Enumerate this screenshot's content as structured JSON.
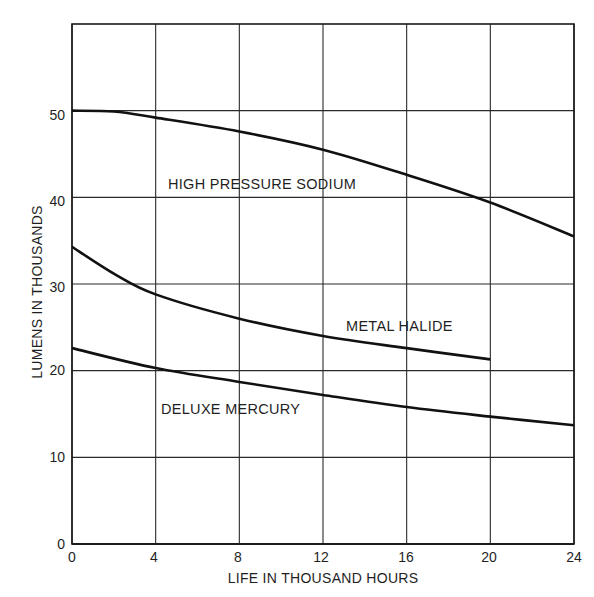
{
  "chart_data": {
    "type": "line",
    "title": "",
    "xlabel": "LIFE IN THOUSAND HOURS",
    "ylabel": "LUMENS IN THOUSANDS",
    "xlim": [
      0,
      24
    ],
    "ylim": [
      0,
      60
    ],
    "xticks": [
      0,
      4,
      8,
      12,
      16,
      20,
      24
    ],
    "yticks": [
      0,
      10,
      20,
      30,
      40,
      50
    ],
    "grid": true,
    "legend": "inline labels",
    "series": [
      {
        "name": "HIGH PRESSURE SODIUM",
        "x": [
          0,
          2,
          4,
          8,
          12,
          16,
          20,
          24
        ],
        "values": [
          50,
          49.9,
          49.2,
          47.6,
          45.5,
          42.6,
          39.4,
          35.5
        ]
      },
      {
        "name": "METAL HALIDE",
        "x": [
          0,
          2,
          4,
          8,
          12,
          16,
          20
        ],
        "values": [
          34.3,
          31.2,
          28.8,
          26.0,
          24.0,
          22.6,
          21.3
        ]
      },
      {
        "name": "DELUXE MERCURY",
        "x": [
          0,
          4,
          8,
          12,
          16,
          20,
          24
        ],
        "values": [
          22.6,
          20.3,
          18.7,
          17.2,
          15.8,
          14.7,
          13.7
        ]
      }
    ]
  },
  "labels": {
    "xlabel": "LIFE IN THOUSAND HOURS",
    "ylabel": "LUMENS IN THOUSANDS",
    "series_hps": "HIGH PRESSURE SODIUM",
    "series_mh": "METAL HALIDE",
    "series_dm": "DELUXE MERCURY"
  },
  "ticks": {
    "x": [
      "0",
      "4",
      "8",
      "12",
      "16",
      "20",
      "24"
    ],
    "y": [
      "0",
      "10",
      "20",
      "30",
      "40",
      "50"
    ]
  },
  "colors": {
    "line": "#111111",
    "grid": "#2a2a2a",
    "background": "#ffffff"
  }
}
